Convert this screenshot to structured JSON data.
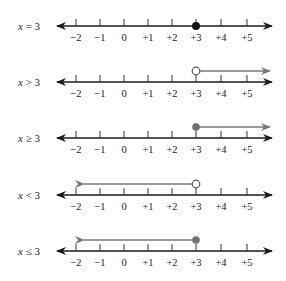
{
  "diagram": {
    "tick_labels": [
      "−2",
      "−1",
      "0",
      "+1",
      "+2",
      "+3",
      "+4",
      "+5"
    ],
    "tick_values": [
      -2,
      -1,
      0,
      1,
      2,
      3,
      4,
      5
    ],
    "colors": {
      "axis": "#1a1a1a",
      "ray": "#7a7a7a",
      "filled_point": "#111111",
      "filled_point_gray": "#707070"
    },
    "rows": [
      {
        "label_var": "x",
        "label_rel": " = 3",
        "point": 3,
        "point_style": "filled-black",
        "ray": "none"
      },
      {
        "label_var": "x",
        "label_rel": " > 3",
        "point": 3,
        "point_style": "open",
        "ray": "right"
      },
      {
        "label_var": "x",
        "label_rel": " ≥ 3",
        "point": 3,
        "point_style": "filled-gray",
        "ray": "right"
      },
      {
        "label_var": "x",
        "label_rel": " < 3",
        "point": 3,
        "point_style": "open",
        "ray": "left"
      },
      {
        "label_var": "x",
        "label_rel": " ≤ 3",
        "point": 3,
        "point_style": "filled-gray",
        "ray": "left"
      }
    ]
  }
}
